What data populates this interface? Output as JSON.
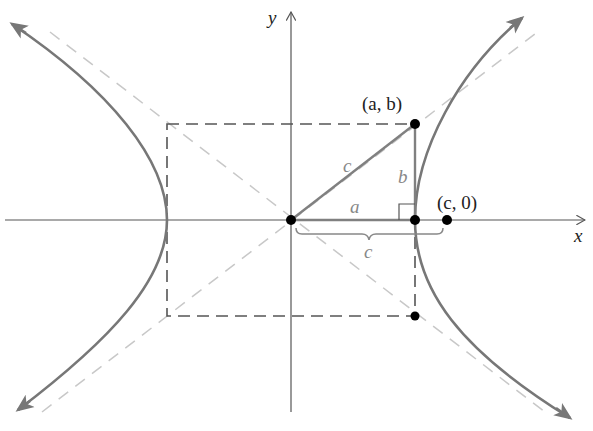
{
  "diagram": {
    "axes": {
      "x_label": "x",
      "y_label": "y"
    },
    "points": {
      "vertex_corner_label": "(a, b)",
      "focus_label": "(c, 0)"
    },
    "segments": {
      "hypotenuse_label": "c",
      "leg_horizontal_label": "a",
      "leg_vertical_label": "b",
      "brace_label": "c"
    },
    "colors": {
      "curve": "#777777",
      "asymptote": "#c8c8c8",
      "rectangle": "#555555",
      "triangle": "#808080",
      "axis": "#555555",
      "point": "#000000",
      "label_gray": "#888888"
    }
  }
}
